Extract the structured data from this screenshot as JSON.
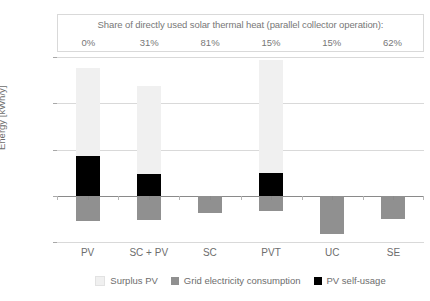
{
  "share_table": {
    "title": "Share of directly used solar thermal heat (parallel collector operation):",
    "values": [
      "0%",
      "31%",
      "81%",
      "15%",
      "15%",
      "62%"
    ]
  },
  "axis": {
    "ylabel": "Energy [kWh/y]",
    "yticks": [
      "7 500",
      "5 000",
      "2 500",
      "0",
      "-2 500"
    ]
  },
  "legend": {
    "items": [
      {
        "label": "Surplus PV",
        "color": "#f0f0f0"
      },
      {
        "label": "Grid electricity consumption",
        "color": "#909090"
      },
      {
        "label": "PV self-usage",
        "color": "#000000"
      }
    ]
  },
  "colors": {
    "surplus_pv": "#f0f0f0",
    "grid_electricity": "#909090",
    "pv_self_usage": "#000000",
    "gridline": "#d9d9d9",
    "axis": "#8a8a8a",
    "text": "#6d6d6d"
  },
  "chart_data": {
    "type": "bar",
    "title": "",
    "subtitle": "Share of directly used solar thermal heat (parallel collector operation):",
    "xlabel": "",
    "ylabel": "Energy [kWh/y]",
    "ylim": [
      -2500,
      7500
    ],
    "ytick_values": [
      7500,
      5000,
      2500,
      0,
      -2500
    ],
    "grid": true,
    "stacked": true,
    "legend_position": "bottom",
    "categories": [
      "PV",
      "SC + PV",
      "SC",
      "PVT",
      "UC",
      "SE"
    ],
    "annotations": {
      "label": "Share of directly used solar thermal heat (parallel collector operation)",
      "values": [
        "0%",
        "31%",
        "81%",
        "15%",
        "15%",
        "62%"
      ]
    },
    "series": [
      {
        "name": "Surplus PV",
        "color": "#f0f0f0",
        "values": [
          4750,
          4750,
          0,
          6100,
          0,
          0
        ]
      },
      {
        "name": "PV self-usage",
        "color": "#000000",
        "values": [
          2150,
          1200,
          0,
          1250,
          0,
          0
        ]
      },
      {
        "name": "Grid electricity consumption",
        "color": "#909090",
        "values": [
          -1350,
          -1300,
          -950,
          -800,
          -2050,
          -1250
        ]
      }
    ],
    "totals_positive": [
      6900,
      5950,
      0,
      7350,
      0,
      0
    ]
  }
}
